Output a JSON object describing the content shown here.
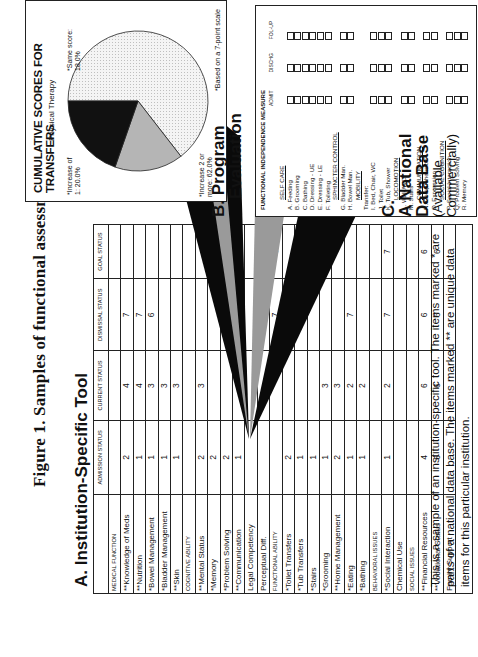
{
  "figure": {
    "title": "Figure 1. Samples of functional assessment tools."
  },
  "section_a": {
    "title": "A. Institution-Specific Tool",
    "columns": [
      "ADMISSION STATUS",
      "CURRENT STATUS",
      "DISMISSAL STATUS",
      "GOAL STATUS"
    ],
    "rows": [
      {
        "label": "MEDICAL FUNCTION",
        "category": true,
        "values": [
          "",
          "",
          "",
          ""
        ]
      },
      {
        "label": "**Knowledge of Meds",
        "values": [
          "2",
          "4",
          "7",
          ""
        ]
      },
      {
        "label": "**Nutrition",
        "values": [
          "1",
          "4",
          "7",
          ""
        ]
      },
      {
        "label": "*Bowel Management",
        "values": [
          "1",
          "3",
          "6",
          ""
        ]
      },
      {
        "label": "*Bladder Management",
        "values": [
          "1",
          "3",
          "",
          ""
        ]
      },
      {
        "label": "**Skin",
        "values": [
          "1",
          "3",
          "",
          ""
        ]
      },
      {
        "label": "COGNITIVE ABILITY",
        "category": true,
        "values": [
          "",
          "",
          "",
          ""
        ]
      },
      {
        "label": "**Mental Status",
        "values": [
          "2",
          "3",
          "",
          ""
        ]
      },
      {
        "label": "*Memory",
        "values": [
          "2",
          "",
          "",
          "7"
        ]
      },
      {
        "label": "*Problem Solving",
        "values": [
          "2",
          "",
          "",
          "7"
        ]
      },
      {
        "label": "**Communication",
        "values": [
          "1",
          "",
          "7",
          "7"
        ]
      },
      {
        "label": "Legal Competency",
        "values": [
          "",
          "",
          "",
          ""
        ]
      },
      {
        "label": "Perceptual Diff.",
        "values": [
          "",
          "",
          "",
          ""
        ]
      },
      {
        "label": "FUNCTIONAL ABILITY",
        "category": true,
        "values": [
          "",
          "",
          "7",
          "6"
        ]
      },
      {
        "label": "*Toilet Transfers",
        "values": [
          "2",
          "",
          "",
          ""
        ]
      },
      {
        "label": "*Tub Transfers",
        "values": [
          "1",
          "",
          "",
          ""
        ]
      },
      {
        "label": "*Stairs",
        "values": [
          "1",
          "",
          "",
          ""
        ]
      },
      {
        "label": "*Grooming",
        "values": [
          "1",
          "3",
          "",
          ""
        ]
      },
      {
        "label": "**Home Management",
        "values": [
          "2",
          "3",
          "",
          ""
        ]
      },
      {
        "label": "*Eating",
        "values": [
          "1",
          "2",
          "7",
          ""
        ]
      },
      {
        "label": "*Bathing",
        "values": [
          "1",
          "2",
          "",
          ""
        ]
      },
      {
        "label": "BEHAVIORAL ISSUES",
        "category": true,
        "values": [
          "",
          "",
          "",
          ""
        ]
      },
      {
        "label": "*Social Interaction",
        "values": [
          "1",
          "2",
          "7",
          "7"
        ]
      },
      {
        "label": "Chemical Use",
        "values": [
          "",
          "",
          "",
          ""
        ]
      },
      {
        "label": "SOCIAL ISSUES",
        "category": true,
        "values": [
          "",
          "",
          "",
          ""
        ]
      },
      {
        "label": "**Financial Resources",
        "values": [
          "4",
          "6",
          "6",
          "6"
        ]
      },
      {
        "label": "**Vocational Status",
        "values": [
          "6",
          "6",
          "6",
          "6"
        ]
      },
      {
        "label": "Family Support",
        "values": [
          "",
          "",
          "",
          ""
        ]
      }
    ],
    "note": "This is a sample of an institution-specific tool.  The items marked * are parts of a national data base.  The items marked ** are unique data items for this particular institution."
  },
  "section_b": {
    "letter": "B.",
    "title_line1": "Program",
    "title_line2": "Evaluation"
  },
  "pie_chart": {
    "title": "CUMULATIVE SCORES FOR TRANSFERS",
    "subtitle": "Physical Therapy",
    "footnote": "*Based on a 7-point scale",
    "labels": {
      "increase1": "*Increase of 1: 20.0%",
      "same": "*Same score: 18.0%",
      "increase2": "*Increase 2 or more: 62.0%"
    }
  },
  "chart_data": {
    "type": "pie",
    "title": "CUMULATIVE SCORES FOR TRANSFERS",
    "subtitle": "Physical Therapy",
    "categories": [
      "Increase 2 or more",
      "Increase of 1",
      "Same score"
    ],
    "values": [
      62.0,
      20.0,
      18.0
    ],
    "unit": "%",
    "colors": [
      "#f2f2f2",
      "#b5b5b5",
      "#111111"
    ],
    "annotations": [
      "*Based on a 7-point scale"
    ]
  },
  "fim": {
    "header": "FUNCTIONAL INDEPENDENCE MEASURE",
    "columns": [
      "ADMIT",
      "DISCHG",
      "FOL-UP"
    ],
    "rows": [
      {
        "label": "SELF CARE",
        "section": true
      },
      {
        "label": "A. Feeding"
      },
      {
        "label": "B. Grooming"
      },
      {
        "label": "C. Bathing"
      },
      {
        "label": "D. Dressing - UE"
      },
      {
        "label": "E. Dressing - LE"
      },
      {
        "label": "F. Toileting"
      },
      {
        "label": "SPHINCTER CONTROL",
        "section": true
      },
      {
        "label": "G. Bladder Man."
      },
      {
        "label": "H. Bowel Man."
      },
      {
        "label": "MOBILITY",
        "section": true
      },
      {
        "label": "Transfer:"
      },
      {
        "label": "I. Bed, Chair, WC"
      },
      {
        "label": "J. Toilet"
      },
      {
        "label": "K. Tub, Shower"
      },
      {
        "label": "LOCOMOTION",
        "section": true
      },
      {
        "label": "L. Walk/WC"
      },
      {
        "label": "M. Stairs"
      },
      {
        "label": "COMMUNICATION",
        "section": true
      },
      {
        "label": "N. Comprehension"
      },
      {
        "label": "O. Expression"
      },
      {
        "label": "SOCIAL COGNITION",
        "section": true
      },
      {
        "label": "P. Social Interaction"
      },
      {
        "label": "Q. Problem Solving"
      },
      {
        "label": "R. Memory"
      }
    ]
  },
  "section_c": {
    "letter": "C.",
    "title_line1": "A National",
    "title_line2": "Data Base",
    "sub_line1": "(Available",
    "sub_line2": "Commercially)"
  }
}
